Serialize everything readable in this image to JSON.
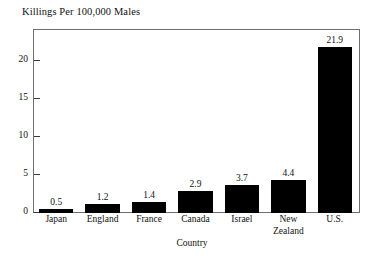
{
  "chart_data": {
    "type": "bar",
    "title": "Killings Per 100,000 Males",
    "xlabel": "Country",
    "ylabel": "",
    "categories": [
      "Japan",
      "England",
      "France",
      "Canada",
      "Israel",
      "New Zealand",
      "U.S."
    ],
    "values": [
      0.5,
      1.2,
      1.4,
      2.9,
      3.7,
      4.4,
      21.9
    ],
    "value_labels": [
      "0.5",
      "1.2",
      "1.4",
      "2.9",
      "3.7",
      "4.4",
      "21.9"
    ],
    "ylim": [
      0,
      24
    ],
    "yticks": [
      0,
      5,
      10,
      15,
      20
    ],
    "ytick_labels": [
      "0",
      "5",
      "10",
      "15",
      "20"
    ],
    "grid": false,
    "legend": false,
    "bar_color": "#000000",
    "frame_color": "#6e6e6e",
    "background": "#ffffff"
  },
  "axis": {
    "x_title": "Country"
  }
}
